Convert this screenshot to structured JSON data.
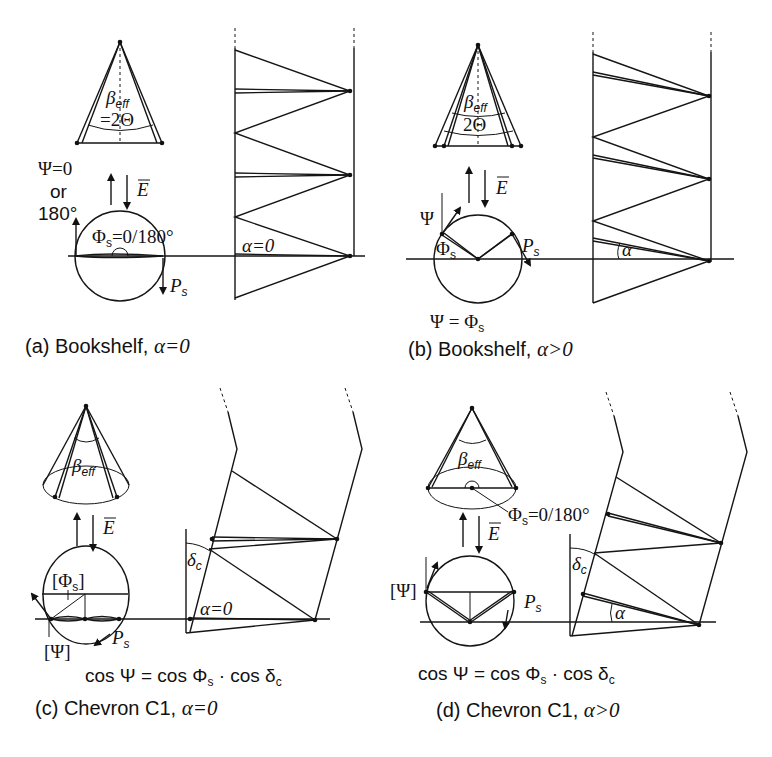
{
  "figure": {
    "panels": [
      {
        "id": "a",
        "caption": "(a) Bookshelf,",
        "caption_math": "α=0",
        "cone_label_beta": "β",
        "cone_label_beta_sub": "eff",
        "cone_label_theta": "=2Θ",
        "psi_label_line1": "Ψ=0",
        "psi_label_line2": "or",
        "psi_label_line3": "180°",
        "field_label": "E",
        "phi_label": "Φ",
        "phi_sub": "s",
        "phi_value": "=0/180°",
        "ps_label": "P",
        "ps_sub": "s",
        "alpha_label": "α=0"
      },
      {
        "id": "b",
        "caption": "(b) Bookshelf,",
        "caption_math": "α>0",
        "cone_label_beta": "β",
        "cone_label_beta_sub": "eff",
        "cone_label_theta": "2Θ",
        "psi_label": "Ψ",
        "field_label": "E",
        "phi_label": "Φ",
        "phi_sub": "s",
        "ps_label": "P",
        "ps_sub": "s",
        "alpha_label": "α",
        "relation": "Ψ = Φ",
        "relation_sub": "s"
      },
      {
        "id": "c",
        "caption": "(c) Chevron C1,",
        "caption_math": "α=0",
        "cone_label_beta": "β",
        "cone_label_beta_sub": "eff",
        "field_label": "E",
        "phi_label": "[Φ",
        "phi_sub": "s",
        "phi_close": "]",
        "psi_label": "[Ψ]",
        "ps_label": "P",
        "ps_sub": "s",
        "delta_label": "δ",
        "delta_sub": "c",
        "alpha_label": "α=0",
        "equation_left": "cos Ψ = cos Φ",
        "equation_sub1": "s",
        "equation_mid": " · cos δ",
        "equation_sub2": "c"
      },
      {
        "id": "d",
        "caption": "(d) Chevron C1,",
        "caption_math": "α>0",
        "cone_label_beta": "β",
        "cone_label_beta_sub": "eff",
        "phi_label": "Φ",
        "phi_sub": "s",
        "phi_value": "=0/180°",
        "field_label": "E",
        "psi_label": "[Ψ]",
        "ps_label": "P",
        "ps_sub": "s",
        "delta_label": "δ",
        "delta_sub": "c",
        "alpha_label": "α",
        "equation_left": "cos Ψ = cos Φ",
        "equation_sub1": "s",
        "equation_mid": " · cos δ",
        "equation_sub2": "c"
      }
    ]
  }
}
